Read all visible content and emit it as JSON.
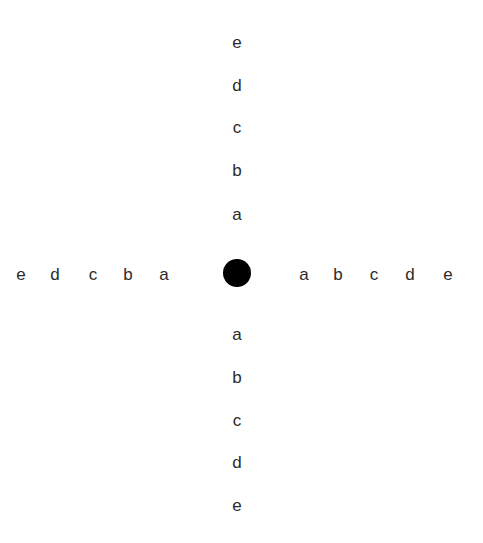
{
  "canvas": {
    "width": 483,
    "height": 543,
    "background_color": "#ffffff"
  },
  "diagram": {
    "type": "cross-letter-chart",
    "center_marker": {
      "shape": "filled-circle",
      "color": "#000000",
      "center_x": 237,
      "center_y": 273,
      "diameter": 28
    },
    "label_color": "#2b2b2b",
    "font_size": 17,
    "arms": [
      {
        "name": "up",
        "direction": "up",
        "axis": "vertical",
        "order": "inner-to-outer",
        "labels": [
          "a",
          "b",
          "c",
          "d",
          "e"
        ],
        "positions": [
          {
            "label": "a",
            "x": 237,
            "y": 214
          },
          {
            "label": "b",
            "x": 237,
            "y": 170
          },
          {
            "label": "c",
            "x": 237,
            "y": 127
          },
          {
            "label": "d",
            "x": 237,
            "y": 85
          },
          {
            "label": "e",
            "x": 237,
            "y": 42
          }
        ]
      },
      {
        "name": "down",
        "direction": "down",
        "axis": "vertical",
        "order": "inner-to-outer",
        "labels": [
          "a",
          "b",
          "c",
          "d",
          "e"
        ],
        "positions": [
          {
            "label": "a",
            "x": 237,
            "y": 334
          },
          {
            "label": "b",
            "x": 237,
            "y": 377
          },
          {
            "label": "c",
            "x": 237,
            "y": 420
          },
          {
            "label": "d",
            "x": 237,
            "y": 462
          },
          {
            "label": "e",
            "x": 237,
            "y": 505
          }
        ]
      },
      {
        "name": "left",
        "direction": "left",
        "axis": "horizontal",
        "order": "inner-to-outer",
        "labels": [
          "a",
          "b",
          "c",
          "d",
          "e"
        ],
        "positions": [
          {
            "label": "a",
            "x": 164,
            "y": 274
          },
          {
            "label": "b",
            "x": 128,
            "y": 274
          },
          {
            "label": "c",
            "x": 93,
            "y": 274
          },
          {
            "label": "d",
            "x": 55,
            "y": 274
          },
          {
            "label": "e",
            "x": 21,
            "y": 274
          }
        ]
      },
      {
        "name": "right",
        "direction": "right",
        "axis": "horizontal",
        "order": "inner-to-outer",
        "labels": [
          "a",
          "b",
          "c",
          "d",
          "e"
        ],
        "positions": [
          {
            "label": "a",
            "x": 304,
            "y": 274
          },
          {
            "label": "b",
            "x": 338,
            "y": 274
          },
          {
            "label": "c",
            "x": 374,
            "y": 274
          },
          {
            "label": "d",
            "x": 410,
            "y": 274
          },
          {
            "label": "e",
            "x": 448,
            "y": 274
          }
        ]
      }
    ]
  }
}
